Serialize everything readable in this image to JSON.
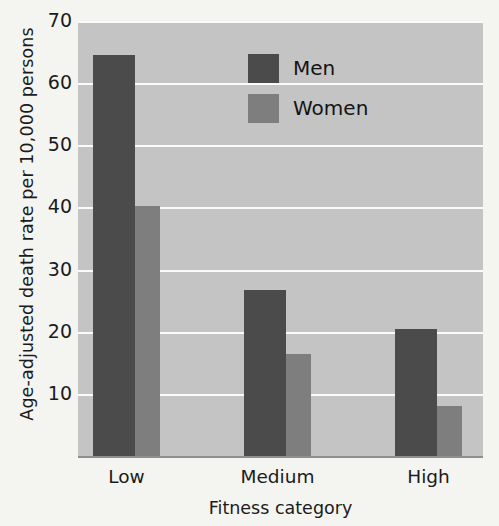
{
  "chart_data": {
    "type": "bar",
    "title": "",
    "xlabel": "Fitness category",
    "ylabel": "Age-adjusted death rate per 10,000 persons",
    "categories": [
      "Low",
      "Medium",
      "High"
    ],
    "series": [
      {
        "name": "Men",
        "color": "#4b4b4b",
        "values": [
          64.5,
          26.7,
          20.5
        ]
      },
      {
        "name": "Women",
        "color": "#7e7e7e",
        "values": [
          40.3,
          16.4,
          8.0
        ]
      }
    ],
    "ylim": [
      0,
      70
    ],
    "yticks": [
      10,
      20,
      30,
      40,
      50,
      60,
      70
    ],
    "ytick_labels": [
      "10",
      "20",
      "30",
      "40",
      "50",
      "60",
      "70"
    ],
    "grid": true,
    "grid_color": "#fbfbfb",
    "legend_position": "top-center",
    "plot_background": "#c4c4c4",
    "page_background": "#f4f4f1"
  },
  "axes": {
    "y_title": "Age-adjusted death rate per 10,000 persons",
    "x_title": "Fitness category"
  },
  "legend": {
    "entries": [
      {
        "label": "Men",
        "color": "#4b4b4b"
      },
      {
        "label": "Women",
        "color": "#7e7e7e"
      }
    ]
  }
}
